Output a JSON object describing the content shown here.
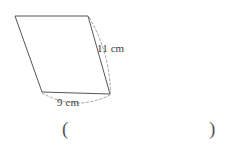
{
  "page": {
    "background_color": "#ffffff",
    "width": 229,
    "height": 149
  },
  "figure": {
    "name": "parallelogram",
    "shape_type": "parallelogram",
    "stroke_color": "#55555a",
    "fill_color": "#ffffff",
    "vertices": [
      {
        "label": "top-left",
        "x": 15,
        "y": 16
      },
      {
        "label": "top-right",
        "x": 88,
        "y": 16
      },
      {
        "label": "bottom-right",
        "x": 110,
        "y": 94
      },
      {
        "label": "bottom-left",
        "x": 42,
        "y": 92
      }
    ],
    "dimension_arcs": [
      {
        "name": "right-side-arc",
        "color": "#9a9a9f",
        "style": "dashed",
        "from_vertex": "top-right",
        "to_vertex": "bottom-right"
      },
      {
        "name": "bottom-side-arc",
        "color": "#9a9a9f",
        "style": "dashed",
        "from_vertex": "bottom-left",
        "to_vertex": "bottom-right"
      }
    ],
    "labels": {
      "side_right": "11 cm",
      "side_bottom": "9 cm"
    },
    "measurements": [
      {
        "side": "right",
        "value": 11,
        "unit": "cm",
        "text": "11 cm"
      },
      {
        "side": "bottom",
        "value": 9,
        "unit": "cm",
        "text": "9 cm"
      }
    ]
  },
  "answer": {
    "paren_open": "(",
    "paren_close": ")",
    "value": "",
    "placeholder": ""
  }
}
